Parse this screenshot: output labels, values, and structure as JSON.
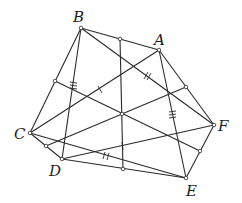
{
  "diagram": {
    "type": "geometry",
    "points": {
      "A": {
        "label": "A",
        "x": 159,
        "y": 50,
        "label_x": 154,
        "label_y": 45
      },
      "B": {
        "label": "B",
        "x": 81,
        "y": 28,
        "label_x": 73,
        "label_y": 22
      },
      "C": {
        "label": "C",
        "x": 30,
        "y": 133,
        "label_x": 14,
        "label_y": 139
      },
      "D": {
        "label": "D",
        "x": 62,
        "y": 159,
        "label_x": 49,
        "label_y": 176
      },
      "E": {
        "label": "E",
        "x": 186,
        "y": 178,
        "label_x": 186,
        "label_y": 196
      },
      "F": {
        "label": "F",
        "x": 214,
        "y": 125,
        "label_x": 218,
        "label_y": 131
      }
    },
    "center": {
      "x": 122,
      "y": 114
    },
    "midpoints": [
      {
        "name": "mid-BA",
        "x": 120,
        "y": 39
      },
      {
        "name": "mid-AF",
        "x": 186,
        "y": 87
      },
      {
        "name": "mid-FE",
        "x": 200,
        "y": 151
      },
      {
        "name": "mid-ED",
        "x": 123,
        "y": 169
      },
      {
        "name": "mid-DC",
        "x": 46,
        "y": 146
      },
      {
        "name": "mid-CB",
        "x": 55,
        "y": 81
      }
    ],
    "labels": [
      "A",
      "B",
      "C",
      "D",
      "E",
      "F"
    ],
    "colors": {
      "stroke": "#2a2a2a",
      "background": "#ffffff"
    }
  }
}
